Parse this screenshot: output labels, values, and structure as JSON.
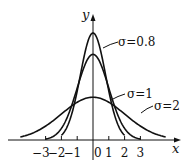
{
  "chart_data": {
    "type": "line",
    "title": "",
    "xlabel": "x",
    "ylabel": "y",
    "x_ticks": [
      -3,
      -2,
      -1,
      0,
      1,
      2,
      3
    ],
    "x_tick_labels": [
      "−3",
      "−2",
      "−1",
      "0",
      "1",
      "2",
      "3"
    ],
    "series": [
      {
        "name": "σ=0.8",
        "sigma": 0.8,
        "peak": 0.4987,
        "x_range": [
          -2,
          2
        ]
      },
      {
        "name": "σ=1",
        "sigma": 1,
        "peak": 0.3989,
        "x_range": [
          -3,
          3
        ]
      },
      {
        "name": "σ=2",
        "sigma": 2,
        "peak": 0.1995,
        "x_range": [
          -4.6,
          4.6
        ]
      }
    ],
    "grid": false,
    "legend": "inline annotations with leader lines"
  },
  "labels": {
    "x_axis": "x",
    "y_axis": "y",
    "sigma_08": "σ=0.8",
    "sigma_1": "σ=1",
    "sigma_2": "σ=2"
  }
}
